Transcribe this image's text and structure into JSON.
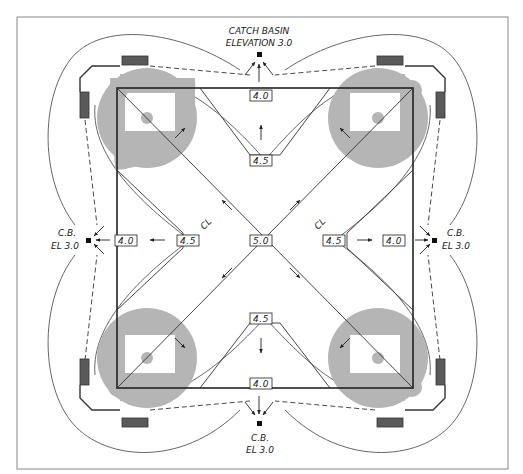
{
  "diagram": {
    "catch_basins": {
      "top": {
        "line1": "CATCH BASIN",
        "line2": "ELEVATION 3.0"
      },
      "left": {
        "line1": "C.B.",
        "line2": "EL 3.0"
      },
      "right": {
        "line1": "C.B.",
        "line2": "EL 3.0"
      },
      "bottom": {
        "line1": "C.B.",
        "line2": "EL 3.0"
      }
    },
    "elevations": {
      "center": "5.0",
      "top_edge": "4.0",
      "bottom_edge": "4.0",
      "left_edge": "4.0",
      "right_edge": "4.0",
      "top_mid": "4.5",
      "bottom_mid": "4.5",
      "left_mid": "4.5",
      "right_mid": "4.5"
    },
    "centerline_marks": {
      "left": "CL",
      "right": "CL"
    },
    "colors": {
      "line": "#333333",
      "infield": "#b3b3b3",
      "dugout": "#5a5a5a",
      "frame": "#777777"
    }
  }
}
